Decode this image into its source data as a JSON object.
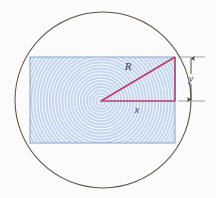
{
  "figure": {
    "background_color": "#fbfbfb",
    "labels": {
      "radius": "R",
      "horizontal": "x",
      "vertical": "y"
    },
    "colors": {
      "circle_stroke": "#595045",
      "rect_fill": "#c3d5ef",
      "rect_stroke": "#7f9cc4",
      "ring_stroke": "#ffffff",
      "triangle_stroke": "#bb3a69",
      "dimension_stroke": "#8a8a8a",
      "label_color": "#2b3a6b"
    },
    "geometry": {
      "circle": {
        "cx": 103,
        "cy": 100,
        "r": 88
      },
      "rectangle": {
        "x": 30,
        "y": 57,
        "width": 145,
        "height": 86
      },
      "vertex": {
        "cx": 101,
        "cy": 101
      },
      "corner": {
        "cx": 175,
        "cy": 57
      },
      "rings": {
        "count": 30,
        "spacing": 3.1
      },
      "dimension": {
        "x": 190,
        "top": 57,
        "bottom": 101
      }
    }
  }
}
